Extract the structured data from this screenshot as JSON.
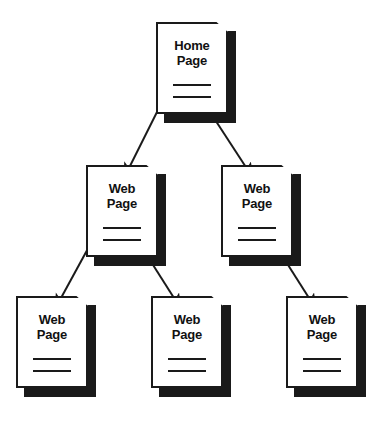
{
  "diagram": {
    "type": "website-hierarchy-tree",
    "colors": {
      "page_fill": "#ffffff",
      "outline": "#1a1a1a",
      "shadow": "#1a1a1a",
      "arrow": "#1a1a1a",
      "background": "#ffffff"
    },
    "nodes": [
      {
        "id": "home",
        "label_line_1": "Home",
        "label_line_2": "Page",
        "level": 0
      },
      {
        "id": "web-1",
        "label_line_1": "Web",
        "label_line_2": "Page",
        "level": 1
      },
      {
        "id": "web-2",
        "label_line_1": "Web",
        "label_line_2": "Page",
        "level": 1
      },
      {
        "id": "web-3",
        "label_line_1": "Web",
        "label_line_2": "Page",
        "level": 2
      },
      {
        "id": "web-4",
        "label_line_1": "Web",
        "label_line_2": "Page",
        "level": 2
      },
      {
        "id": "web-5",
        "label_line_1": "Web",
        "label_line_2": "Page",
        "level": 2
      }
    ],
    "edges": [
      {
        "from": "home",
        "to": "web-1",
        "arrow": true
      },
      {
        "from": "home",
        "to": "web-2",
        "arrow": true
      },
      {
        "from": "web-1",
        "to": "web-3",
        "arrow": true
      },
      {
        "from": "web-1",
        "to": "web-4",
        "arrow": true
      },
      {
        "from": "web-2",
        "to": "web-5",
        "arrow": true
      }
    ]
  }
}
